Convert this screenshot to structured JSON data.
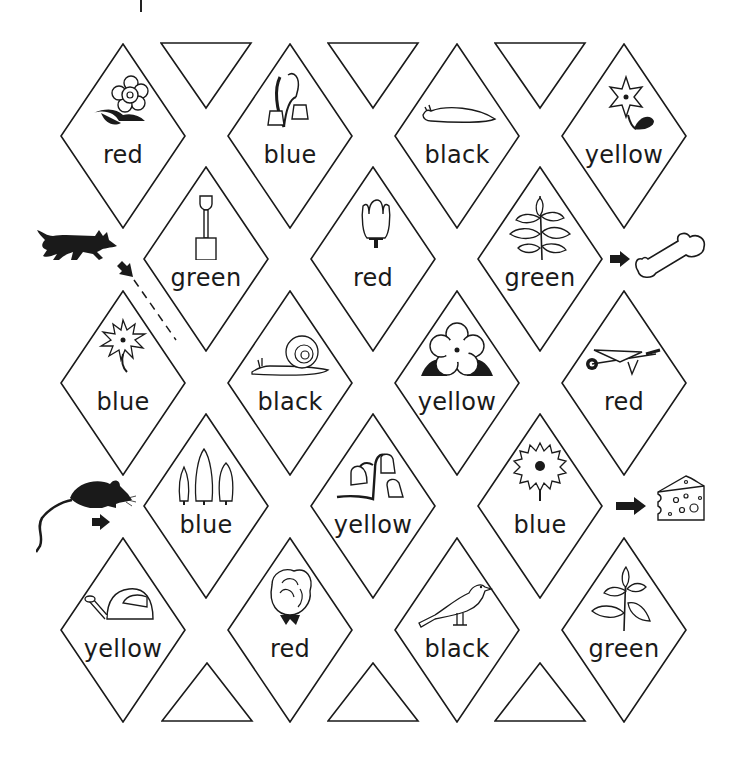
{
  "game": {
    "type": "colour-word maze",
    "tiles": [
      {
        "row": 0,
        "col": 0,
        "cx": 123,
        "cy": 136,
        "label": "red",
        "picture": "flower-with-leaves"
      },
      {
        "row": 0,
        "col": 1,
        "cx": 290,
        "cy": 136,
        "label": "blue",
        "picture": "bluebells"
      },
      {
        "row": 0,
        "col": 2,
        "cx": 457,
        "cy": 136,
        "label": "black",
        "picture": "slug"
      },
      {
        "row": 0,
        "col": 3,
        "cx": 624,
        "cy": 136,
        "label": "yellow",
        "picture": "star-flower"
      },
      {
        "row": 1,
        "col": 0,
        "cx": 206,
        "cy": 259,
        "label": "green",
        "picture": "spade"
      },
      {
        "row": 1,
        "col": 1,
        "cx": 373,
        "cy": 259,
        "label": "red",
        "picture": "tulip"
      },
      {
        "row": 1,
        "col": 2,
        "cx": 540,
        "cy": 259,
        "label": "green",
        "picture": "leafy-plant"
      },
      {
        "row": 2,
        "col": 0,
        "cx": 123,
        "cy": 383,
        "label": "blue",
        "picture": "daisy"
      },
      {
        "row": 2,
        "col": 1,
        "cx": 290,
        "cy": 383,
        "label": "black",
        "picture": "snail"
      },
      {
        "row": 2,
        "col": 2,
        "cx": 457,
        "cy": 383,
        "label": "yellow",
        "picture": "primrose"
      },
      {
        "row": 2,
        "col": 3,
        "cx": 624,
        "cy": 383,
        "label": "red",
        "picture": "wheelbarrow"
      },
      {
        "row": 3,
        "col": 0,
        "cx": 206,
        "cy": 506,
        "label": "blue",
        "picture": "fir-trees"
      },
      {
        "row": 3,
        "col": 1,
        "cx": 373,
        "cy": 506,
        "label": "yellow",
        "picture": "bluebells-stem"
      },
      {
        "row": 3,
        "col": 2,
        "cx": 540,
        "cy": 506,
        "label": "blue",
        "picture": "sunflower"
      },
      {
        "row": 4,
        "col": 0,
        "cx": 123,
        "cy": 630,
        "label": "yellow",
        "picture": "watering-can"
      },
      {
        "row": 4,
        "col": 1,
        "cx": 290,
        "cy": 630,
        "label": "red",
        "picture": "rose"
      },
      {
        "row": 4,
        "col": 2,
        "cx": 457,
        "cy": 630,
        "label": "black",
        "picture": "bird"
      },
      {
        "row": 4,
        "col": 3,
        "cx": 624,
        "cy": 630,
        "label": "green",
        "picture": "leafy-plant-2"
      }
    ],
    "top_triangles": [
      206,
      373,
      540
    ],
    "bottom_triangles": [
      207,
      373,
      540
    ],
    "start_markers": [
      {
        "name": "dog",
        "icon": "dog-silhouette-icon"
      },
      {
        "name": "mouse",
        "icon": "mouse-silhouette-icon"
      }
    ],
    "end_markers": [
      {
        "name": "bone",
        "icon": "bone-icon"
      },
      {
        "name": "cheese",
        "icon": "cheese-icon"
      }
    ],
    "colors": {
      "ink": "#1a1a1a",
      "paper": "#ffffff"
    }
  }
}
